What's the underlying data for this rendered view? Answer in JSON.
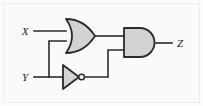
{
  "diagram": {
    "type": "digital-logic-schematic",
    "expression": "Z = (X + Y) · Y'",
    "background_color": "#fafafa",
    "frame_color": "#ececec",
    "wire_color": "#2b2b2b",
    "gate_fill": "#d3d3d3",
    "gate_stroke": "#2b2b2b",
    "labels": {
      "input_x": "X",
      "input_y": "Y",
      "output_z": "Z"
    },
    "gates": [
      {
        "id": "or1",
        "kind": "OR",
        "inputs": 2,
        "label": ""
      },
      {
        "id": "not1",
        "kind": "NOT",
        "inputs": 1,
        "label": ""
      },
      {
        "id": "and1",
        "kind": "AND",
        "inputs": 2,
        "label": ""
      }
    ],
    "nets": [
      {
        "from": "X",
        "to": "or1.in0"
      },
      {
        "from": "Y",
        "to": "or1.in1"
      },
      {
        "from": "Y",
        "to": "not1.in0"
      },
      {
        "from": "or1.out",
        "to": "and1.in0"
      },
      {
        "from": "not1.out",
        "to": "and1.in1"
      },
      {
        "from": "and1.out",
        "to": "Z"
      }
    ]
  }
}
